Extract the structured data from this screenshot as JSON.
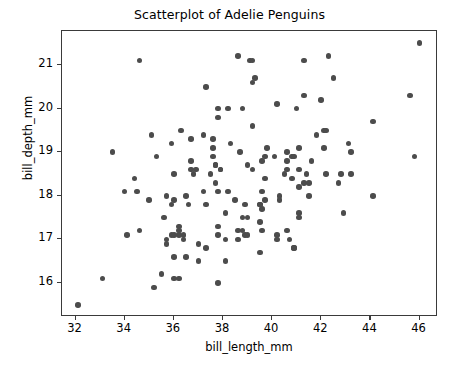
{
  "chart_data": {
    "type": "scatter",
    "title": "Scatterplot of Adelie Penguins",
    "xlabel": "bill_length_mm",
    "ylabel": "bill_depth_mm",
    "xlim": [
      31.45,
      46.75
    ],
    "ylim": [
      15.22,
      21.78
    ],
    "xticks": [
      32,
      34,
      36,
      38,
      40,
      42,
      44,
      46
    ],
    "yticks": [
      16,
      17,
      18,
      19,
      20,
      21
    ],
    "grid": false,
    "legend": null,
    "marker_color": "#4c4c4c",
    "marker_size_px": 5.6,
    "series": [
      {
        "name": "Adelie",
        "points": [
          [
            32.1,
            15.5
          ],
          [
            33.1,
            16.1
          ],
          [
            33.5,
            19.0
          ],
          [
            34.0,
            18.1
          ],
          [
            34.1,
            17.1
          ],
          [
            34.4,
            18.4
          ],
          [
            34.5,
            18.1
          ],
          [
            34.6,
            21.1
          ],
          [
            34.6,
            17.2
          ],
          [
            35.0,
            17.9
          ],
          [
            35.1,
            19.4
          ],
          [
            35.2,
            15.9
          ],
          [
            35.3,
            18.9
          ],
          [
            35.5,
            16.2
          ],
          [
            35.6,
            17.5
          ],
          [
            35.7,
            18.0
          ],
          [
            35.7,
            17.0
          ],
          [
            35.7,
            16.9
          ],
          [
            35.9,
            19.2
          ],
          [
            35.9,
            17.8
          ],
          [
            35.9,
            17.1
          ],
          [
            36.0,
            18.5
          ],
          [
            36.0,
            17.9
          ],
          [
            36.0,
            17.1
          ],
          [
            36.0,
            16.6
          ],
          [
            36.0,
            16.1
          ],
          [
            36.2,
            17.3
          ],
          [
            36.2,
            17.2
          ],
          [
            36.2,
            17.1
          ],
          [
            36.2,
            16.1
          ],
          [
            36.3,
            19.5
          ],
          [
            36.4,
            17.1
          ],
          [
            36.4,
            17.0
          ],
          [
            36.5,
            18.0
          ],
          [
            36.5,
            16.6
          ],
          [
            36.6,
            17.8
          ],
          [
            36.7,
            18.8
          ],
          [
            36.7,
            19.3
          ],
          [
            36.7,
            18.6
          ],
          [
            36.8,
            18.5
          ],
          [
            36.9,
            18.6
          ],
          [
            37.0,
            16.9
          ],
          [
            37.0,
            16.5
          ],
          [
            37.2,
            19.4
          ],
          [
            37.2,
            18.1
          ],
          [
            37.3,
            20.5
          ],
          [
            37.3,
            17.8
          ],
          [
            37.3,
            16.8
          ],
          [
            37.5,
            18.5
          ],
          [
            37.6,
            19.3
          ],
          [
            37.6,
            19.1
          ],
          [
            37.6,
            18.9
          ],
          [
            37.7,
            18.7
          ],
          [
            37.7,
            18.3
          ],
          [
            37.7,
            18.7
          ],
          [
            37.8,
            20.0
          ],
          [
            37.8,
            19.8
          ],
          [
            37.8,
            18.1
          ],
          [
            37.8,
            17.3
          ],
          [
            37.8,
            17.1
          ],
          [
            37.8,
            16.0
          ],
          [
            37.9,
            18.6
          ],
          [
            37.9,
            18.6
          ],
          [
            38.1,
            17.6
          ],
          [
            38.1,
            17.0
          ],
          [
            38.1,
            16.5
          ],
          [
            38.2,
            18.1
          ],
          [
            38.2,
            20.0
          ],
          [
            38.3,
            19.2
          ],
          [
            38.5,
            17.9
          ],
          [
            38.6,
            21.2
          ],
          [
            38.6,
            17.2
          ],
          [
            38.6,
            17.0
          ],
          [
            38.7,
            19.0
          ],
          [
            38.8,
            17.2
          ],
          [
            38.8,
            17.5
          ],
          [
            38.8,
            20.0
          ],
          [
            38.9,
            17.8
          ],
          [
            38.9,
            17.1
          ],
          [
            39.0,
            17.5
          ],
          [
            39.0,
            18.7
          ],
          [
            39.0,
            17.1
          ],
          [
            39.1,
            21.1
          ],
          [
            39.2,
            20.6
          ],
          [
            39.2,
            19.6
          ],
          [
            39.2,
            18.6
          ],
          [
            39.2,
            21.1
          ],
          [
            39.3,
            20.7
          ],
          [
            39.5,
            17.8
          ],
          [
            39.5,
            16.7
          ],
          [
            39.5,
            17.4
          ],
          [
            39.5,
            17.8
          ],
          [
            39.6,
            17.7
          ],
          [
            39.6,
            18.1
          ],
          [
            39.6,
            18.8
          ],
          [
            39.6,
            17.2
          ],
          [
            39.7,
            18.4
          ],
          [
            39.7,
            17.9
          ],
          [
            39.7,
            18.9
          ],
          [
            39.8,
            19.1
          ],
          [
            40.1,
            18.9
          ],
          [
            40.2,
            20.1
          ],
          [
            40.2,
            17.1
          ],
          [
            40.2,
            17.0
          ],
          [
            40.3,
            18.0
          ],
          [
            40.3,
            17.9
          ],
          [
            40.5,
            18.5
          ],
          [
            40.6,
            18.8
          ],
          [
            40.6,
            19.0
          ],
          [
            40.6,
            18.6
          ],
          [
            40.6,
            17.2
          ],
          [
            40.7,
            17.0
          ],
          [
            40.8,
            18.9
          ],
          [
            40.8,
            18.4
          ],
          [
            40.9,
            18.9
          ],
          [
            40.9,
            16.8
          ],
          [
            40.9,
            16.8
          ],
          [
            41.0,
            20.0
          ],
          [
            41.1,
            18.2
          ],
          [
            41.1,
            17.5
          ],
          [
            41.1,
            17.6
          ],
          [
            41.1,
            18.6
          ],
          [
            41.1,
            19.1
          ],
          [
            41.3,
            21.1
          ],
          [
            41.3,
            20.3
          ],
          [
            41.3,
            18.3
          ],
          [
            41.4,
            18.5
          ],
          [
            41.5,
            18.3
          ],
          [
            41.5,
            18.0
          ],
          [
            41.6,
            18.8
          ],
          [
            41.8,
            19.4
          ],
          [
            42.0,
            20.2
          ],
          [
            42.1,
            19.1
          ],
          [
            42.1,
            19.5
          ],
          [
            42.2,
            18.5
          ],
          [
            42.2,
            19.5
          ],
          [
            42.3,
            21.2
          ],
          [
            42.5,
            20.7
          ],
          [
            42.7,
            18.3
          ],
          [
            42.8,
            18.5
          ],
          [
            42.9,
            17.6
          ],
          [
            43.1,
            19.2
          ],
          [
            43.2,
            19.0
          ],
          [
            43.2,
            18.5
          ],
          [
            44.1,
            19.7
          ],
          [
            44.1,
            18.0
          ],
          [
            45.6,
            20.3
          ],
          [
            45.8,
            18.9
          ],
          [
            46.0,
            21.5
          ]
        ]
      }
    ]
  }
}
